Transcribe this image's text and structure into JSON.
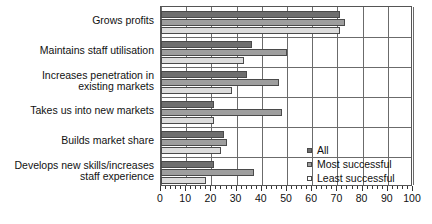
{
  "chart_data": {
    "type": "bar",
    "orientation": "horizontal",
    "title": "",
    "xlabel": "",
    "ylabel": "",
    "xlim": [
      0,
      100
    ],
    "xticks": [
      0,
      10,
      20,
      30,
      40,
      50,
      60,
      70,
      80,
      90,
      100
    ],
    "xtick_labels": [
      "0",
      "10",
      "20",
      "30",
      "40",
      "50",
      "60",
      "70",
      "80",
      "90",
      "100"
    ],
    "grid": true,
    "legend_position": "inside-lower-right",
    "categories": [
      "Grows profits",
      "Maintains staff utilisation",
      "Increases penetration in\nexisting markets",
      "Takes us into new markets",
      "Builds market share",
      "Develops new skills/increases\nstaff experience"
    ],
    "series": [
      {
        "name": "All",
        "color": "#6e6e6e",
        "values": [
          71,
          36,
          34,
          21,
          25,
          21
        ]
      },
      {
        "name": "Most successful",
        "color": "#9e9e9e",
        "values": [
          73,
          50,
          47,
          48,
          26,
          37
        ]
      },
      {
        "name": "Least successful",
        "color": "#dcdcdc",
        "values": [
          71,
          33,
          28,
          21,
          24,
          18
        ]
      }
    ]
  },
  "legend": {
    "entries": [
      {
        "label": "All"
      },
      {
        "label": "Most successful"
      },
      {
        "label": "Least successful"
      }
    ]
  }
}
